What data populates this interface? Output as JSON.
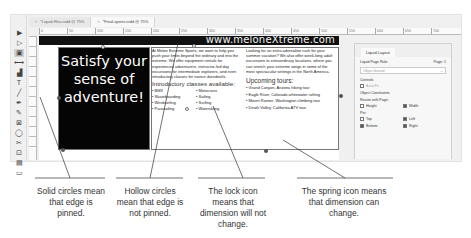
{
  "window": {
    "tabs": [
      {
        "label": "*Liquid-Flex.indd @ 75%",
        "active": false
      },
      {
        "label": "*Final-sports.indd @ 75%",
        "active": true
      }
    ],
    "ruler_ticks": [
      "0",
      "50",
      "100",
      "150",
      "200",
      "250",
      "300",
      "350",
      "400",
      "450",
      "500",
      "550",
      "600",
      "650",
      "700"
    ]
  },
  "toolbar": {
    "tools": [
      {
        "name": "selection-tool",
        "glyph": "▶"
      },
      {
        "name": "direct-selection-tool",
        "glyph": "▷"
      },
      {
        "name": "page-tool",
        "glyph": "▣",
        "active": true
      },
      {
        "name": "gap-tool",
        "glyph": "⟷"
      },
      {
        "name": "content-collector-tool",
        "glyph": "▟"
      },
      {
        "name": "type-tool",
        "glyph": "T"
      },
      {
        "name": "line-tool",
        "glyph": "╱"
      },
      {
        "name": "pen-tool",
        "glyph": "✒"
      },
      {
        "name": "pencil-tool",
        "glyph": "✎"
      },
      {
        "name": "rectangle-frame-tool",
        "glyph": "⊠"
      },
      {
        "name": "ellipse-tool",
        "glyph": "◯"
      },
      {
        "name": "scissors-tool",
        "glyph": "✂"
      },
      {
        "name": "free-transform-tool",
        "glyph": "⊡"
      },
      {
        "name": "gradient-tool",
        "glyph": "▤"
      },
      {
        "name": "note-tool",
        "glyph": "▭"
      }
    ]
  },
  "page": {
    "banner_url": "www.meloneXtreme.com",
    "hero_text": [
      "Satisfy your",
      "sense of",
      "adventure!"
    ],
    "intro_paragraph": "At Melon Extreme Sports, we want to help you push your limits beyond the ordinary and into the extreme. We offer equipment rentals for experienced adventurers, instructor-led day excursions for intermediate explorers, and even introductory classes for novice daredevils.",
    "intro_heading": "Introductory classes available:",
    "classes": [
      "BMX",
      "Motocross",
      "Skateboarding",
      "Sailing",
      "Windsurfing",
      "Surfing",
      "Parasailing",
      "Waterskiing"
    ],
    "summer_paragraph": "Looking for an extra adrenaline rush for your summer vacation? We also offer week-long adult excursions to extraordinary locations, where you can stretch your extreme wings in some of the most spectacular settings in the North America.",
    "tours_heading": "Upcoming tours:",
    "tours": [
      "Grand Canyon, Arizona hiking tour",
      "Eagle River, Colorado whitewater rafting",
      "Mount Rainier, Washington climbing tour",
      "Death Valley, California ATV tour"
    ]
  },
  "panel": {
    "title": "Liquid Layout",
    "rule_label": "Liquid Page Rule:",
    "page_label": "Page: 1",
    "rule_value": "Object-based",
    "controls_label": "Controls",
    "auto_fit": {
      "label": "Auto-Fit",
      "checked": false,
      "disabled": true
    },
    "constraints_label": "Object Constraints",
    "resize_label": "Resize with Page:",
    "height": {
      "label": "Height",
      "checked": false
    },
    "width": {
      "label": "Width",
      "checked": true
    },
    "pin_label": "Pin:",
    "top": {
      "label": "Top",
      "checked": false
    },
    "left": {
      "label": "Left",
      "checked": true
    },
    "bottom": {
      "label": "Bottom",
      "checked": true
    },
    "right": {
      "label": "Right",
      "checked": true
    }
  },
  "callouts": [
    {
      "text": "Solid circles mean that edge is pinned."
    },
    {
      "text": "Hollow circles mean that edge is not pinned."
    },
    {
      "text": "The lock icon means that dimension will not change."
    },
    {
      "text": "The spring icon means that dimension can change."
    }
  ],
  "colors": {
    "banner": "#111111",
    "hero_bg": "#050505",
    "hero_text": "#ffffff",
    "panel_bg": "#efefef"
  }
}
